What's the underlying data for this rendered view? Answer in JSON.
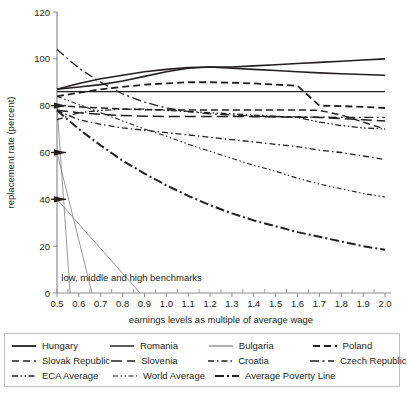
{
  "chart_data": {
    "type": "line",
    "title": "",
    "xlabel": "earnings levels as multiple of average wage",
    "ylabel": "replacement rate (percent)",
    "xlim": [
      0.5,
      2.0
    ],
    "ylim": [
      0,
      120
    ],
    "grid": false,
    "legend_position": "bottom",
    "xticks": [
      "0.5",
      "0.6",
      "0.7",
      "0.8",
      "0.9",
      "1.0",
      "1.1",
      "1.2",
      "1.3",
      "1.4",
      "1.5",
      "1.6",
      "1.7",
      "1.8",
      "1.9",
      "2.0"
    ],
    "yticks": [
      "0",
      "20",
      "40",
      "60",
      "80",
      "100",
      "120"
    ],
    "x": [
      0.5,
      0.6,
      0.7,
      0.8,
      0.9,
      1.0,
      1.1,
      1.2,
      1.3,
      1.4,
      1.5,
      1.6,
      1.7,
      1.8,
      1.9,
      2.0
    ],
    "annotations": [
      {
        "text": "low, middle and high benchmarks",
        "x": 0.52,
        "y": 5
      }
    ],
    "benchmark_markers": [
      80,
      60,
      40
    ],
    "series": [
      {
        "name": "Hungary",
        "style": "solid",
        "width": 1.6,
        "color": "#231f20",
        "values": [
          87,
          88,
          89,
          90.5,
          92.5,
          94.5,
          96,
          96.5,
          96.5,
          97,
          97.5,
          98,
          98.5,
          99,
          99.5,
          100
        ]
      },
      {
        "name": "Romania",
        "style": "solid",
        "width": 1.6,
        "color": "#4a4a4a",
        "values": [
          87,
          89.5,
          91.5,
          93,
          94.5,
          95.5,
          96.3,
          96.5,
          96,
          95.5,
          95,
          94.5,
          94,
          93.6,
          93.3,
          93
        ]
      },
      {
        "name": "Bulgaria",
        "style": "solid",
        "width": 1.4,
        "color": "#9a9a9a",
        "values": [
          86,
          86,
          86,
          86,
          86,
          86,
          86,
          86,
          86,
          86,
          86,
          86,
          86,
          86,
          86,
          86
        ]
      },
      {
        "name": "Poland",
        "style": "dashed",
        "width": 1.8,
        "color": "#231f20",
        "values": [
          84,
          85.5,
          87,
          88,
          89,
          89.5,
          90,
          90,
          89.8,
          89.5,
          89,
          88.5,
          80,
          79.8,
          79.5,
          79
        ]
      },
      {
        "name": "Slovak Republic",
        "style": "dashed",
        "width": 1.5,
        "color": "#231f20",
        "values": [
          80,
          79.5,
          79,
          78.6,
          78.3,
          78.2,
          78.2,
          78.2,
          78.2,
          78.2,
          78.2,
          78.2,
          78,
          76,
          73,
          70
        ]
      },
      {
        "name": "Slovenia",
        "style": "longdash",
        "width": 1.5,
        "color": "#231f20",
        "values": [
          78,
          77,
          76.3,
          75.8,
          75.5,
          75.4,
          75.4,
          75.4,
          75.4,
          75.3,
          75.2,
          75.1,
          75,
          74.5,
          74,
          73.5
        ]
      },
      {
        "name": "Croatia",
        "style": "dashdot",
        "width": 1.3,
        "color": "#231f20",
        "values": [
          78,
          74,
          72,
          70.5,
          69.5,
          68.5,
          67.5,
          66.5,
          65.5,
          64.5,
          63.5,
          62.5,
          61,
          60,
          58.5,
          57
        ]
      },
      {
        "name": "Czech Republic",
        "style": "dashdotlong",
        "width": 1.3,
        "color": "#231f20",
        "values": [
          104,
          96,
          90,
          85,
          81.5,
          79,
          77.5,
          76.5,
          76,
          75.6,
          75.3,
          75.2,
          75.1,
          75,
          75,
          75
        ]
      },
      {
        "name": "ECA Average",
        "style": "dashdotdot",
        "width": 1.3,
        "color": "#231f20",
        "values": [
          74,
          77,
          78,
          78.5,
          78.5,
          78,
          77.5,
          77,
          76.5,
          76,
          75.5,
          75,
          73,
          71.5,
          70.5,
          70
        ]
      },
      {
        "name": "World Average",
        "style": "dashdotdot-thin",
        "width": 1.1,
        "color": "#6b6b6b",
        "values": [
          84,
          80.5,
          77,
          73.5,
          70,
          67,
          63.5,
          60.5,
          57.5,
          54.5,
          52,
          49,
          46.5,
          44.5,
          42.5,
          41
        ]
      },
      {
        "name": "Average Poverty Line",
        "style": "dashdot-thick",
        "width": 2.0,
        "color": "#231f20",
        "values": [
          78,
          70,
          63,
          56.5,
          51,
          46,
          41.5,
          37.5,
          34,
          31,
          28.5,
          26,
          24,
          22,
          20,
          18.5
        ]
      }
    ],
    "benchmark_lines": [
      {
        "name": "low-benchmark",
        "x0": 0.5,
        "y0": 80,
        "x1": 0.56,
        "y1": 0
      },
      {
        "name": "middle-benchmark",
        "x0": 0.5,
        "y0": 60,
        "x1": 0.66,
        "y1": 0
      },
      {
        "name": "high-benchmark",
        "x0": 0.5,
        "y0": 40,
        "x1": 0.88,
        "y1": 0
      }
    ]
  },
  "axes": {
    "ylabel": "replacement rate (percent)",
    "xlabel": "earnings levels as multiple of average wage",
    "yticks": [
      "120",
      "100",
      "80",
      "60",
      "40",
      "20",
      "0"
    ],
    "xticks": [
      "0.5",
      "0.6",
      "0.7",
      "0.8",
      "0.9",
      "1.0",
      "1.1",
      "1.2",
      "1.3",
      "1.4",
      "1.5",
      "1.6",
      "1.7",
      "1.8",
      "1.9",
      "2.0"
    ]
  },
  "annotation": {
    "benchmarks_label": "low, middle and high benchmarks"
  },
  "legend": {
    "rows": [
      [
        {
          "label": "Hungary",
          "style": "solid",
          "color": "#231f20",
          "width": 1.8
        },
        {
          "label": "Romania",
          "style": "solid",
          "color": "#4a4a4a",
          "width": 1.8
        },
        {
          "label": "Bulgaria",
          "style": "solid",
          "color": "#9a9a9a",
          "width": 1.5
        },
        {
          "label": "Poland",
          "style": "dashed",
          "color": "#231f20",
          "width": 1.8
        }
      ],
      [
        {
          "label": "Slovak Republic",
          "style": "dashed",
          "color": "#231f20",
          "width": 1.5
        },
        {
          "label": "Slovenia",
          "style": "longdash",
          "color": "#231f20",
          "width": 1.6
        },
        {
          "label": "Croatia",
          "style": "dashdot",
          "color": "#231f20",
          "width": 1.5
        },
        {
          "label": "Czech Republic",
          "style": "dashdotlong",
          "color": "#231f20",
          "width": 1.4
        }
      ],
      [
        {
          "label": "ECA Average",
          "style": "dashdotdot",
          "color": "#231f20",
          "width": 1.5
        },
        {
          "label": "World Average",
          "style": "dashdotdot-thin",
          "color": "#6b6b6b",
          "width": 1.3
        },
        {
          "label": "Average Poverty Line",
          "style": "dashdot-thick",
          "color": "#231f20",
          "width": 2.0
        }
      ]
    ]
  }
}
